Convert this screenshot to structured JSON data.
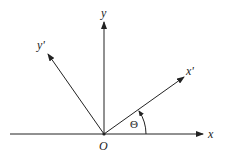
{
  "diagram": {
    "origin_label": "O",
    "axes": [
      {
        "id": "x",
        "label": "x"
      },
      {
        "id": "y",
        "label": "y"
      },
      {
        "id": "x_prime",
        "label": "x'"
      },
      {
        "id": "y_prime",
        "label": "y'"
      }
    ],
    "angle_label": "Θ",
    "line_color": "#222222"
  }
}
